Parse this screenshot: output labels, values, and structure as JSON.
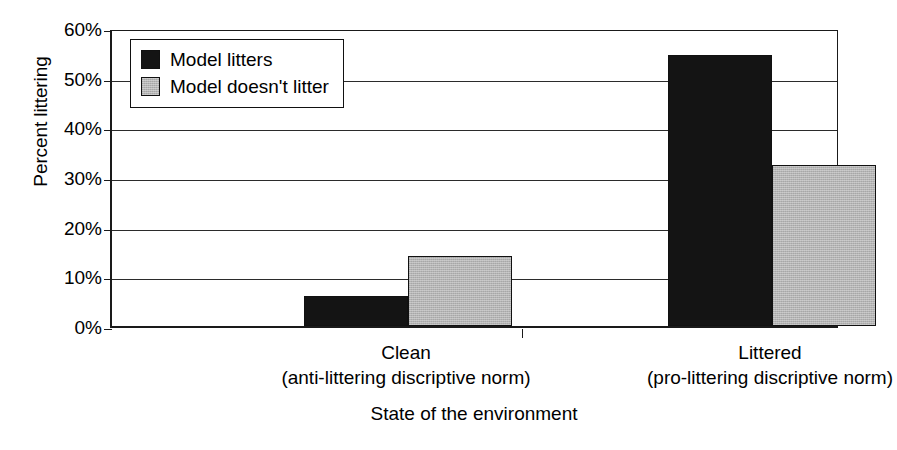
{
  "chart_data": {
    "type": "bar",
    "title": "",
    "xlabel": "State of the environment",
    "ylabel": "Percent littering",
    "categories": [
      "Clean",
      "Littered"
    ],
    "category_sublabels": [
      "(anti-littering discriptive norm)",
      "(pro-littering discriptive norm)"
    ],
    "series": [
      {
        "name": "Model litters",
        "values": [
          6,
          54.5
        ],
        "color": "#141414"
      },
      {
        "name": "Model doesn't litter",
        "values": [
          14,
          32.5
        ],
        "color": "#b4b4b4"
      }
    ],
    "ylim": [
      0,
      60
    ],
    "ytick_step": 10,
    "ytick_labels": [
      "60%",
      "50%",
      "40%",
      "30%",
      "20%",
      "10%",
      "0%"
    ],
    "ytick_values": [
      60,
      50,
      40,
      30,
      20,
      10,
      0
    ],
    "grid": "horizontal",
    "legend_position": "top-left-inside",
    "value_format": "percent"
  },
  "legend": {
    "entries": [
      {
        "label": "Model litters",
        "swatch": "black-swatch-icon"
      },
      {
        "label": "Model doesn't litter",
        "swatch": "grey-swatch-icon"
      }
    ]
  },
  "axes": {
    "y_title": "Percent littering",
    "x_title": "State of the environment"
  }
}
